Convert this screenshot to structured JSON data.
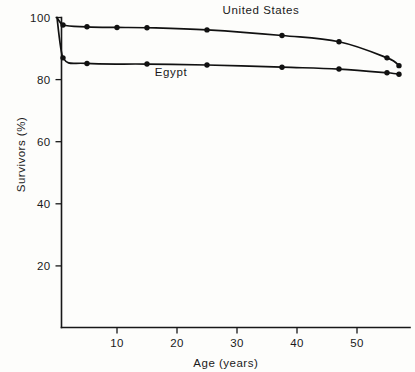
{
  "chart_data": {
    "type": "line",
    "title": "",
    "xlabel": "Age (years)",
    "ylabel": "Survivors (%)",
    "xlim": [
      0,
      58
    ],
    "ylim": [
      0,
      103
    ],
    "xticks": [
      10,
      20,
      30,
      40,
      50
    ],
    "yticks": [
      20,
      40,
      60,
      80,
      100
    ],
    "xtick_labels": [
      "10",
      "20",
      "30",
      "40",
      "50"
    ],
    "ytick_labels": [
      "20",
      "40",
      "60",
      "80",
      "100"
    ],
    "grid": false,
    "legend_position": "inline-annotations",
    "series": [
      {
        "name": "United States",
        "label": "United States",
        "label_x": 34,
        "label_y": 101,
        "x": [
          0,
          1,
          5,
          10,
          15,
          25,
          37.5,
          47,
          55,
          57
        ],
        "y": [
          100,
          97.6,
          97.0,
          96.8,
          96.7,
          96.0,
          94.2,
          92.2,
          87.0,
          84.5
        ]
      },
      {
        "name": "Egypt",
        "label": "Egypt",
        "label_x": 19,
        "label_y": 81,
        "x": [
          0,
          1,
          5,
          15,
          25,
          37.5,
          47,
          55,
          57
        ],
        "y": [
          100,
          87.0,
          85.2,
          85.0,
          84.7,
          84.0,
          83.4,
          82.2,
          81.7
        ]
      }
    ]
  },
  "axes": {
    "y_axis_title": "Survivors (%)",
    "x_axis_title": "Age (years)"
  },
  "annotations": {
    "united_states": "United States",
    "egypt": "Egypt"
  }
}
